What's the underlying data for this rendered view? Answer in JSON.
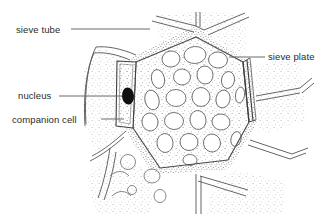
{
  "figure": {
    "kind": "phloem-tissue-line-drawing",
    "background_color": "#ffffff",
    "ink_color": "#4a4a4a",
    "nucleus_color": "#111111",
    "text_color": "#2b2b2b"
  },
  "labels": {
    "sieve_tube": "sieve tube",
    "nucleus": "nucleus",
    "companion_cell": "companion cell",
    "sieve_plate": "sieve plate"
  },
  "leader_lines": {
    "sieve_tube": {
      "x1": 71,
      "y1": 29,
      "x2": 150,
      "y2": 29
    },
    "nucleus": {
      "x1": 59,
      "y1": 96,
      "x2": 122,
      "y2": 96
    },
    "companion_cell": {
      "x1": 101,
      "y1": 119,
      "x2": 124,
      "y2": 119
    },
    "sieve_plate": {
      "x1": 229,
      "y1": 57,
      "x2": 265,
      "y2": 57
    }
  },
  "structures": {
    "sieve_tube_cell": "large central polygonal sieve tube element",
    "companion_cell": "narrow vertical companion cell left of sieve tube",
    "nucleus": "dark ellipse inside companion cell",
    "sieve_plate": "double-line cell wall on upper-right boundary",
    "vacuole_count": 21
  }
}
